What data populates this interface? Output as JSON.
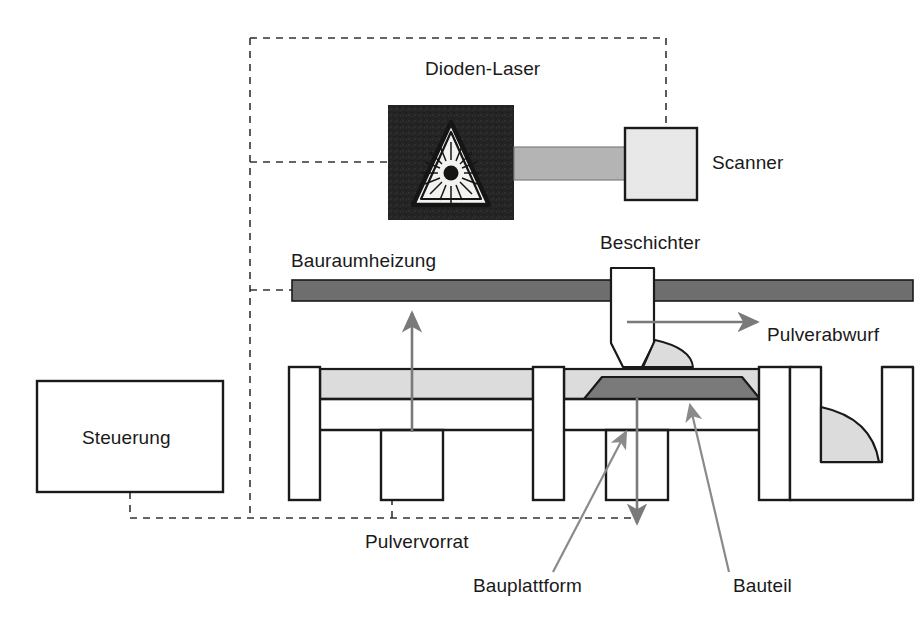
{
  "diagram": {
    "language": "de",
    "labels": {
      "diode_laser": "Dioden-Laser",
      "scanner": "Scanner",
      "build_chamber_heating": "Bauraumheizung",
      "recoater": "Beschichter",
      "powder_discharge": "Pulverabwurf",
      "control_unit": "Steuerung",
      "powder_supply": "Pulvervorrat",
      "build_platform": "Bauplattform",
      "part": "Bauteil"
    },
    "icons": {
      "laser_warning": "laser-warning-triangle-icon",
      "recoater_travel": "arrow-right-icon",
      "powder_piston_up": "arrow-up-icon",
      "platform_piston_down": "arrow-down-icon",
      "leader_build_platform": "leader-arrow-icon",
      "leader_part": "leader-arrow-icon"
    },
    "colors": {
      "stroke": "#1a1a1a",
      "laser_box_fill": "#242424",
      "scanner_fill": "#e8e8e8",
      "beam_fill": "#b4b4b4",
      "heater_bar_fill": "#6e6e6e",
      "powder_fill": "#dcdcdc",
      "part_fill": "#7a7a7a",
      "arrow_gray": "#7a7a7a",
      "dashed_line": "#333333",
      "page_background": "#ffffff"
    },
    "connections": {
      "control_to_scanner": "dashed",
      "control_to_laser": "dashed",
      "control_to_heating": "dashed",
      "control_to_platform": "dashed"
    }
  }
}
